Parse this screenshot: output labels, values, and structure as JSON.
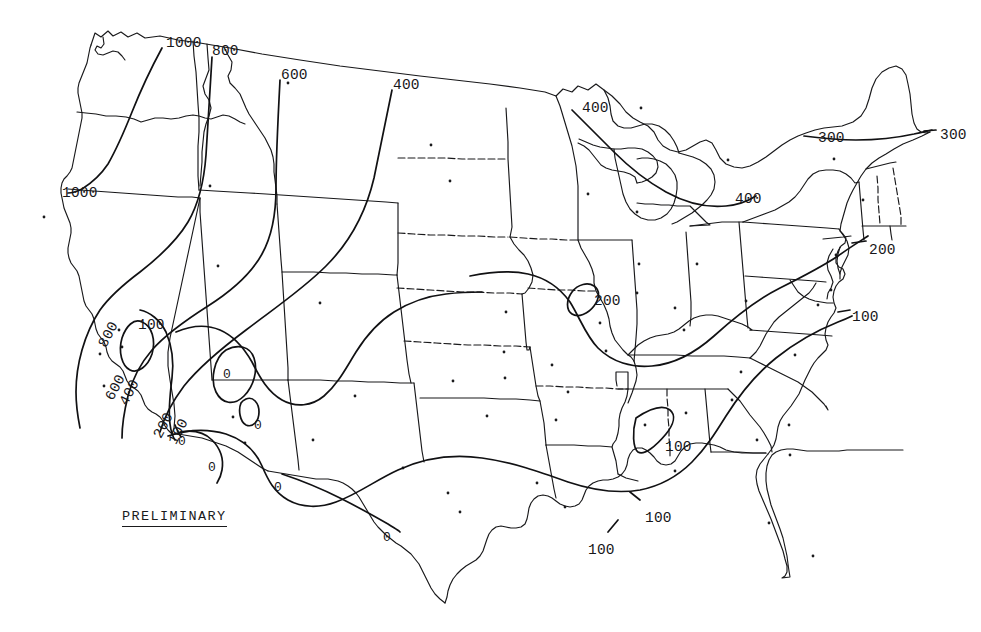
{
  "map": {
    "title": "PRELIMINARY",
    "region": "Contiguous United States",
    "annotation_label": "PRELIMINARY",
    "background_color": "#ffffff",
    "line_color": "#18181a",
    "contour_color": "#111113"
  },
  "chart_data": {
    "type": "contour-map",
    "title": "PRELIMINARY",
    "xlabel": "",
    "ylabel": "",
    "contour_interval": 100,
    "contour_levels": [
      0,
      100,
      200,
      300,
      400,
      600,
      800,
      1000
    ],
    "value_range": [
      0,
      1000
    ],
    "grid": false,
    "legend": "none",
    "annotations": [
      "PRELIMINARY"
    ],
    "labels": [
      {
        "text": "1000",
        "x": 166,
        "y": 36,
        "rotation": 0,
        "level": 1000
      },
      {
        "text": "800",
        "x": 212,
        "y": 44,
        "rotation": 0,
        "level": 800
      },
      {
        "text": "600",
        "x": 281,
        "y": 68,
        "rotation": 0,
        "level": 600
      },
      {
        "text": "400",
        "x": 393,
        "y": 78,
        "rotation": 0,
        "level": 400
      },
      {
        "text": "400",
        "x": 582,
        "y": 101,
        "rotation": 0,
        "level": 400
      },
      {
        "text": "300",
        "x": 818,
        "y": 131,
        "rotation": 0,
        "level": 300
      },
      {
        "text": "300",
        "x": 940,
        "y": 128,
        "rotation": 0,
        "level": 300
      },
      {
        "text": "1000",
        "x": 62,
        "y": 186,
        "rotation": 0,
        "level": 1000
      },
      {
        "text": "400",
        "x": 735,
        "y": 192,
        "rotation": 0,
        "level": 400
      },
      {
        "text": "200",
        "x": 869,
        "y": 243,
        "rotation": 0,
        "level": 200
      },
      {
        "text": "200",
        "x": 594,
        "y": 294,
        "rotation": 0,
        "level": 200
      },
      {
        "text": "100",
        "x": 852,
        "y": 310,
        "rotation": 0,
        "level": 100
      },
      {
        "text": "100",
        "x": 138,
        "y": 318,
        "rotation": 0,
        "level": 100
      },
      {
        "text": "800",
        "x": 96,
        "y": 343,
        "rotation": -62,
        "level": 800
      },
      {
        "text": "0",
        "x": 223,
        "y": 368,
        "rotation": 0,
        "level": 0
      },
      {
        "text": "600",
        "x": 103,
        "y": 396,
        "rotation": -62,
        "level": 600
      },
      {
        "text": "400",
        "x": 117,
        "y": 401,
        "rotation": -62,
        "level": 400
      },
      {
        "text": "0",
        "x": 254,
        "y": 419,
        "rotation": 0,
        "level": 0
      },
      {
        "text": "200",
        "x": 151,
        "y": 434,
        "rotation": -62,
        "level": 200
      },
      {
        "text": "100",
        "x": 166,
        "y": 440,
        "rotation": -62,
        "level": 100
      },
      {
        "text": "0",
        "x": 178,
        "y": 435,
        "rotation": 0,
        "level": 0
      },
      {
        "text": "100",
        "x": 665,
        "y": 440,
        "rotation": 0,
        "level": 100
      },
      {
        "text": "0",
        "x": 208,
        "y": 461,
        "rotation": 0,
        "level": 0
      },
      {
        "text": "0",
        "x": 274,
        "y": 481,
        "rotation": 0,
        "level": 0
      },
      {
        "text": "100",
        "x": 645,
        "y": 511,
        "rotation": 0,
        "level": 100
      },
      {
        "text": "0",
        "x": 383,
        "y": 531,
        "rotation": 0,
        "level": 0
      },
      {
        "text": "100",
        "x": 588,
        "y": 543,
        "rotation": 0,
        "level": 100
      }
    ]
  }
}
